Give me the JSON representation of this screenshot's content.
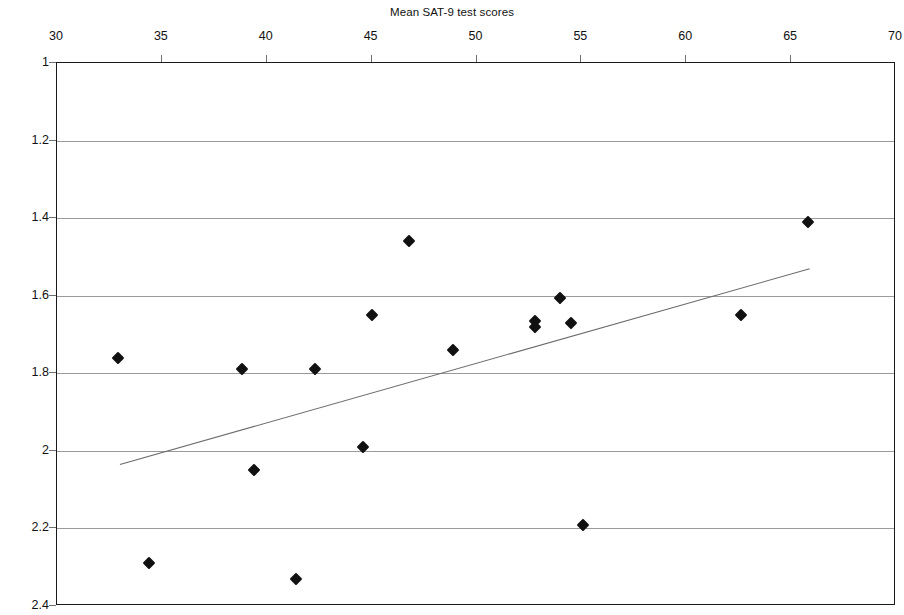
{
  "chart_data": {
    "type": "scatter",
    "title": "Mean SAT-9 test scores",
    "xlabel": "Mean SAT-9 test scores",
    "ylabel": "Mean school culture scores",
    "xlim": [
      30,
      70
    ],
    "ylim": [
      1,
      2.4
    ],
    "y_axis_inverted": true,
    "grid": true,
    "legend": "none",
    "x_ticks": [
      30,
      35,
      40,
      45,
      50,
      55,
      60,
      65,
      70
    ],
    "x_tick_labels": [
      "30",
      "35",
      "40",
      "45",
      "50",
      "55",
      "60",
      "65",
      "70"
    ],
    "y_ticks": [
      1,
      1.2,
      1.4,
      1.6,
      1.8,
      2,
      2.2,
      2.4
    ],
    "y_tick_labels": [
      "1",
      "1.2",
      "1.4",
      "1.6",
      "1.8",
      "2",
      "2.2",
      "2.4"
    ],
    "marker": "filled-diamond",
    "marker_color": "#111111",
    "points": [
      {
        "x": 32.9,
        "y": 1.76
      },
      {
        "x": 34.4,
        "y": 2.29
      },
      {
        "x": 38.8,
        "y": 1.79
      },
      {
        "x": 39.4,
        "y": 2.05
      },
      {
        "x": 41.4,
        "y": 2.33
      },
      {
        "x": 42.3,
        "y": 1.79
      },
      {
        "x": 44.6,
        "y": 1.99
      },
      {
        "x": 45.0,
        "y": 1.65
      },
      {
        "x": 46.8,
        "y": 1.46
      },
      {
        "x": 48.9,
        "y": 1.74
      },
      {
        "x": 52.8,
        "y": 1.665
      },
      {
        "x": 52.8,
        "y": 1.68
      },
      {
        "x": 54.0,
        "y": 1.605
      },
      {
        "x": 54.5,
        "y": 1.67
      },
      {
        "x": 55.1,
        "y": 2.19
      },
      {
        "x": 62.6,
        "y": 1.65
      },
      {
        "x": 65.8,
        "y": 1.41
      }
    ],
    "trendline": {
      "type": "linear",
      "color": "#6b6b6b",
      "x_start": 33.0,
      "y_start": 2.035,
      "x_end": 65.9,
      "y_end": 1.53
    }
  }
}
